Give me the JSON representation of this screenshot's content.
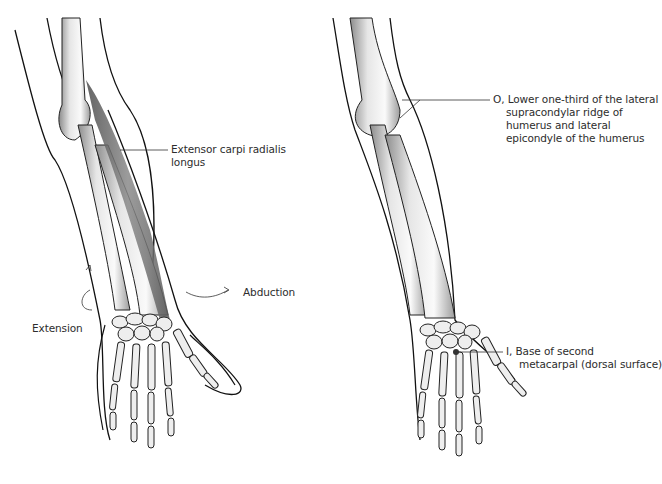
{
  "panels": [
    {
      "id": "left",
      "caption": "Muscle view",
      "muscle_label": {
        "line1": "Extensor carpi radialis",
        "line2": "longus"
      },
      "motions": [
        {
          "label": "Extension"
        },
        {
          "label": "Abduction"
        }
      ]
    },
    {
      "id": "right",
      "origin_label": {
        "line1": "O, Lower one-third of the lateral",
        "line2": "supracondylar ridge of",
        "line3": "humerus and lateral",
        "line4": "epicondyle of the humerus"
      },
      "insertion_label": {
        "line1": "I, Base of second",
        "line2": "metacarpal (dorsal surface)"
      }
    }
  ],
  "colors": {
    "line": "#111111",
    "bone_fill": "#f4f4f4",
    "bone_shade": "#9a9a9a",
    "muscle": "#6e6e6e",
    "text": "#2d2d2d"
  }
}
